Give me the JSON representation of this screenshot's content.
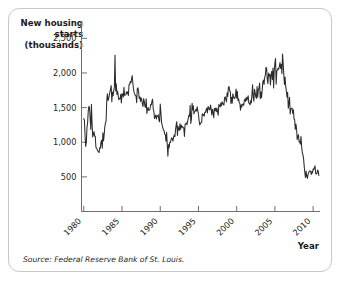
{
  "figure": {
    "y_axis_title_lines": [
      "New housing",
      "starts",
      "(thousands)"
    ],
    "x_axis_title": "Year",
    "source_note": "Source: Federal Reserve Bank of St. Louis.",
    "border_color": "#c9c9c9",
    "line_color": "#2b2b2b",
    "axis_color": "#6f6f6f"
  },
  "chart_data": {
    "type": "line",
    "title": "",
    "xlabel": "Year",
    "ylabel": "New housing starts (thousands)",
    "ylim": [
      0,
      2750
    ],
    "xlim": [
      1979.7,
      2010.9
    ],
    "grid": false,
    "legend": "none",
    "ytick_labels": [
      "2,500",
      "2,000",
      "1,500",
      "1,000",
      "500"
    ],
    "ytick_values": [
      2500,
      2000,
      1500,
      1000,
      500
    ],
    "xtick_labels": [
      "1980",
      "1985",
      "1990",
      "1995",
      "2000",
      "2005",
      "2010"
    ],
    "xtick_values": [
      1980,
      1985,
      1990,
      1995,
      2000,
      2005,
      2010
    ],
    "xtick_label_rotation_deg": -45,
    "series": [
      {
        "name": "New housing starts",
        "x": [
          1980.0,
          1980.083,
          1980.167,
          1980.25,
          1980.333,
          1980.417,
          1980.5,
          1980.583,
          1980.667,
          1980.75,
          1980.833,
          1980.917,
          1981.0,
          1981.083,
          1981.167,
          1981.25,
          1981.333,
          1981.417,
          1981.5,
          1981.583,
          1981.667,
          1981.75,
          1981.833,
          1981.917,
          1982.0,
          1982.083,
          1982.167,
          1982.25,
          1982.333,
          1982.417,
          1982.5,
          1982.583,
          1982.667,
          1982.75,
          1982.833,
          1982.917,
          1983.0,
          1983.083,
          1983.167,
          1983.25,
          1983.333,
          1983.417,
          1983.5,
          1983.583,
          1983.667,
          1983.75,
          1983.833,
          1983.917,
          1984.0,
          1984.083,
          1984.167,
          1984.25,
          1984.333,
          1984.417,
          1984.5,
          1984.583,
          1984.667,
          1984.75,
          1984.833,
          1984.917,
          1985.0,
          1985.083,
          1985.167,
          1985.25,
          1985.333,
          1985.417,
          1985.5,
          1985.583,
          1985.667,
          1985.75,
          1985.833,
          1985.917,
          1986.0,
          1986.083,
          1986.167,
          1986.25,
          1986.333,
          1986.417,
          1986.5,
          1986.583,
          1986.667,
          1986.75,
          1986.833,
          1986.917,
          1987.0,
          1987.083,
          1987.167,
          1987.25,
          1987.333,
          1987.417,
          1987.5,
          1987.583,
          1987.667,
          1987.75,
          1987.833,
          1987.917,
          1988.0,
          1988.083,
          1988.167,
          1988.25,
          1988.333,
          1988.417,
          1988.5,
          1988.583,
          1988.667,
          1988.75,
          1988.833,
          1988.917,
          1989.0,
          1989.083,
          1989.167,
          1989.25,
          1989.333,
          1989.417,
          1989.5,
          1989.583,
          1989.667,
          1989.75,
          1989.833,
          1989.917,
          1990.0,
          1990.083,
          1990.167,
          1990.25,
          1990.333,
          1990.417,
          1990.5,
          1990.583,
          1990.667,
          1990.75,
          1990.833,
          1990.917,
          1991.0,
          1991.083,
          1991.167,
          1991.25,
          1991.333,
          1991.417,
          1991.5,
          1991.583,
          1991.667,
          1991.75,
          1991.833,
          1991.917,
          1992.0,
          1992.083,
          1992.167,
          1992.25,
          1992.333,
          1992.417,
          1992.5,
          1992.583,
          1992.667,
          1992.75,
          1992.833,
          1992.917,
          1993.0,
          1993.083,
          1993.167,
          1993.25,
          1993.333,
          1993.417,
          1993.5,
          1993.583,
          1993.667,
          1993.75,
          1993.833,
          1993.917,
          1994.0,
          1994.083,
          1994.167,
          1994.25,
          1994.333,
          1994.417,
          1994.5,
          1994.583,
          1994.667,
          1994.75,
          1994.833,
          1994.917,
          1995.0,
          1995.083,
          1995.167,
          1995.25,
          1995.333,
          1995.417,
          1995.5,
          1995.583,
          1995.667,
          1995.75,
          1995.833,
          1995.917,
          1996.0,
          1996.083,
          1996.167,
          1996.25,
          1996.333,
          1996.417,
          1996.5,
          1996.583,
          1996.667,
          1996.75,
          1996.833,
          1996.917,
          1997.0,
          1997.083,
          1997.167,
          1997.25,
          1997.333,
          1997.417,
          1997.5,
          1997.583,
          1997.667,
          1997.75,
          1997.833,
          1997.917,
          1998.0,
          1998.083,
          1998.167,
          1998.25,
          1998.333,
          1998.417,
          1998.5,
          1998.583,
          1998.667,
          1998.75,
          1998.833,
          1998.917,
          1999.0,
          1999.083,
          1999.167,
          1999.25,
          1999.333,
          1999.417,
          1999.5,
          1999.583,
          1999.667,
          1999.75,
          1999.833,
          1999.917,
          2000.0,
          2000.083,
          2000.167,
          2000.25,
          2000.333,
          2000.417,
          2000.5,
          2000.583,
          2000.667,
          2000.75,
          2000.833,
          2000.917,
          2001.0,
          2001.083,
          2001.167,
          2001.25,
          2001.333,
          2001.417,
          2001.5,
          2001.583,
          2001.667,
          2001.75,
          2001.833,
          2001.917,
          2002.0,
          2002.083,
          2002.167,
          2002.25,
          2002.333,
          2002.417,
          2002.5,
          2002.583,
          2002.667,
          2002.75,
          2002.833,
          2002.917,
          2003.0,
          2003.083,
          2003.167,
          2003.25,
          2003.333,
          2003.417,
          2003.5,
          2003.583,
          2003.667,
          2003.75,
          2003.833,
          2003.917,
          2004.0,
          2004.083,
          2004.167,
          2004.25,
          2004.333,
          2004.417,
          2004.5,
          2004.583,
          2004.667,
          2004.75,
          2004.833,
          2004.917,
          2005.0,
          2005.083,
          2005.167,
          2005.25,
          2005.333,
          2005.417,
          2005.5,
          2005.583,
          2005.667,
          2005.75,
          2005.833,
          2005.917,
          2006.0,
          2006.083,
          2006.167,
          2006.25,
          2006.333,
          2006.417,
          2006.5,
          2006.583,
          2006.667,
          2006.75,
          2006.833,
          2006.917,
          2007.0,
          2007.083,
          2007.167,
          2007.25,
          2007.333,
          2007.417,
          2007.5,
          2007.583,
          2007.667,
          2007.75,
          2007.833,
          2007.917,
          2008.0,
          2008.083,
          2008.167,
          2008.25,
          2008.333,
          2008.417,
          2008.5,
          2008.583,
          2008.667,
          2008.75,
          2008.833,
          2008.917,
          2009.0,
          2009.083,
          2009.167,
          2009.25,
          2009.333,
          2009.417,
          2009.5,
          2009.583,
          2009.667,
          2009.75,
          2009.833,
          2009.917,
          2010.0,
          2010.083,
          2010.167,
          2010.25,
          2010.333,
          2010.417,
          2010.5,
          2010.583,
          2010.667,
          2010.75
        ],
        "values": [
          1341,
          1317,
          1079,
          939,
          1001,
          1215,
          1281,
          1452,
          1519,
          1497,
          1337,
          1184,
          1547,
          1273,
          1077,
          1109,
          1154,
          1086,
          1085,
          932,
          910,
          894,
          872,
          864,
          850,
          924,
          915,
          1002,
          1028,
          913,
          1135,
          1020,
          1110,
          1222,
          1281,
          1303,
          1586,
          1698,
          1602,
          1629,
          1675,
          1725,
          1770,
          1818,
          1585,
          1724,
          1670,
          1744,
          1794,
          2260,
          1740,
          1845,
          1688,
          1737,
          1672,
          1614,
          1631,
          1627,
          1692,
          1566,
          1702,
          1690,
          1650,
          1794,
          1676,
          1683,
          1684,
          1728,
          1703,
          1729,
          1674,
          1829,
          1833,
          1877,
          1858,
          1911,
          1963,
          1851,
          1770,
          1716,
          1694,
          1670,
          1670,
          1570,
          1774,
          1784,
          1726,
          1633,
          1656,
          1588,
          1640,
          1616,
          1547,
          1516,
          1629,
          1591,
          1515,
          1503,
          1627,
          1416,
          1474,
          1502,
          1458,
          1463,
          1481,
          1544,
          1538,
          1592,
          1621,
          1479,
          1445,
          1343,
          1367,
          1394,
          1336,
          1379,
          1375,
          1397,
          1315,
          1295,
          1551,
          1437,
          1289,
          1248,
          1212,
          1177,
          1171,
          1115,
          1110,
          1014,
          1145,
          969,
          798,
          965,
          921,
          1001,
          996,
          1036,
          1063,
          1049,
          1015,
          1079,
          1103,
          1079,
          1176,
          1250,
          1297,
          1099,
          1229,
          1182,
          1171,
          1267,
          1186,
          1248,
          1216,
          1227,
          1210,
          1210,
          1083,
          1258,
          1260,
          1280,
          1254,
          1300,
          1343,
          1392,
          1376,
          1533,
          1272,
          1337,
          1564,
          1465,
          1526,
          1409,
          1439,
          1450,
          1474,
          1450,
          1511,
          1455,
          1407,
          1316,
          1249,
          1266,
          1284,
          1287,
          1412,
          1390,
          1402,
          1376,
          1433,
          1431,
          1467,
          1491,
          1424,
          1516,
          1504,
          1467,
          1472,
          1538,
          1473,
          1392,
          1475,
          1431,
          1355,
          1490,
          1457,
          1492,
          1442,
          1494,
          1437,
          1390,
          1546,
          1520,
          1510,
          1566,
          1525,
          1584,
          1567,
          1540,
          1536,
          1641,
          1655,
          1614,
          1582,
          1715,
          1660,
          1792,
          1804,
          1738,
          1737,
          1561,
          1649,
          1562,
          1698,
          1662,
          1629,
          1636,
          1663,
          1769,
          1636,
          1737,
          1604,
          1626,
          1575,
          1559,
          1463,
          1541,
          1507,
          1549,
          1551,
          1532,
          1600,
          1625,
          1590,
          1649,
          1605,
          1636,
          1670,
          1567,
          1562,
          1540,
          1602,
          1568,
          1698,
          1829,
          1642,
          1592,
          1764,
          1717,
          1655,
          1633,
          1804,
          1648,
          1753,
          1788,
          1853,
          1629,
          1726,
          1643,
          1751,
          1867,
          1897,
          1833,
          1939,
          1967,
          2083,
          2067,
          1911,
          1846,
          1998,
          1957,
          1979,
          1828,
          1978,
          2024,
          1905,
          2072,
          1782,
          2042,
          2144,
          2207,
          1836,
          2027,
          2041,
          2068,
          2054,
          2095,
          2151,
          2065,
          2123,
          1989,
          2273,
          2132,
          1972,
          1832,
          1942,
          1802,
          1737,
          1650,
          1720,
          1491,
          1570,
          1649,
          1409,
          1480,
          1491,
          1490,
          1415,
          1470,
          1334,
          1330,
          1183,
          1264,
          1197,
          1037,
          1084,
          1107,
          1005,
          1013,
          973,
          1084,
          937,
          849,
          817,
          767,
          651,
          560,
          490,
          583,
          510,
          478,
          532,
          562,
          583,
          586,
          585,
          534,
          574,
          557,
          614,
          604,
          634,
          659,
          549,
          539,
          546,
          599,
          585,
          519
        ]
      }
    ]
  }
}
